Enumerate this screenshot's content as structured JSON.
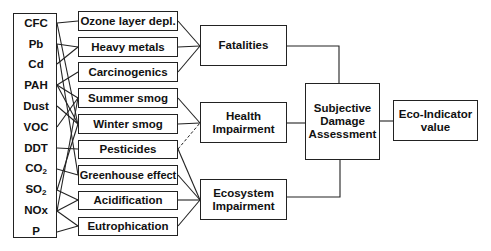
{
  "substances": [
    "CFC",
    "Pb",
    "Cd",
    "PAH",
    "Dust",
    "VOC",
    "DDT",
    "CO",
    "SO",
    "NOx",
    "P"
  ],
  "substance_subscripts": {
    "CO": "2",
    "SO": "2"
  },
  "effects": [
    "Ozone layer depl.",
    "Heavy metals",
    "Carcinogenics",
    "Summer smog",
    "Winter smog",
    "Pesticides",
    "Greenhouse effect",
    "Acidification",
    "Eutrophication"
  ],
  "damages": {
    "fatalities": "Fatalities",
    "health_1": "Health",
    "health_2": "Impairment",
    "ecosystem_1": "Ecosystem",
    "ecosystem_2": "Impairment"
  },
  "assessment": {
    "line1": "Subjective",
    "line2": "Damage",
    "line3": "Assessment"
  },
  "result": {
    "line1": "Eco-Indicator",
    "line2": "value"
  }
}
